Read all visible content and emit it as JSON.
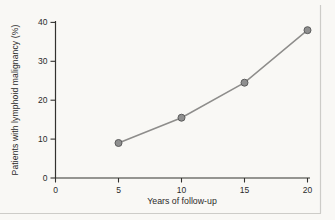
{
  "figure": {
    "background": "#f9f8f5",
    "frame_color": "#cdccc8"
  },
  "chart_data": {
    "type": "line",
    "title": "",
    "xlabel": "Years of follow-up",
    "ylabel": "Patients with lymphoid malignancy (%)",
    "x": [
      5,
      10,
      15,
      20
    ],
    "series": [
      {
        "name": "Patients with lymphoid malignancy",
        "values": [
          9,
          15.5,
          24.5,
          38
        ]
      }
    ],
    "xlim": [
      0,
      20
    ],
    "ylim": [
      0,
      40
    ],
    "x_ticks": [
      0,
      5,
      10,
      15,
      20
    ],
    "y_ticks": [
      0,
      10,
      20,
      30,
      40
    ],
    "grid": false,
    "legend": false,
    "axis_color": "#33322f",
    "line_color": "#8e8d8b",
    "marker_fill": "#8f8f8f",
    "marker_stroke": "#5c5c5c"
  }
}
